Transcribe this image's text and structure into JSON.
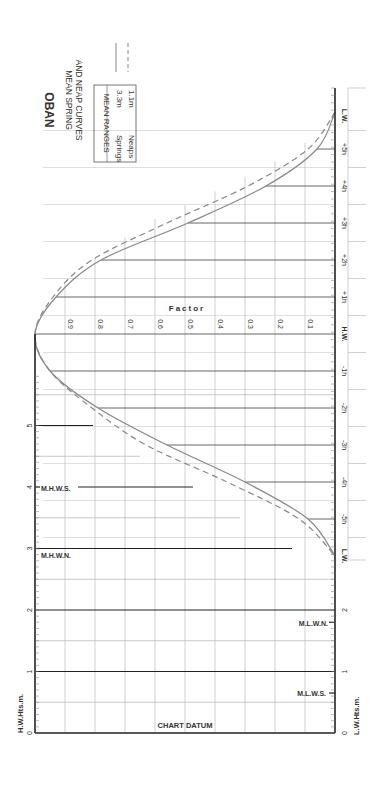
{
  "title": "OBAN",
  "subtitle_line1": "MEAN SPRING",
  "subtitle_line2": "AND NEAP CURVES",
  "legend": {
    "header": "MEAN RANGES",
    "rows": [
      {
        "label": "Springs",
        "value": "3.3m",
        "style": "solid"
      },
      {
        "label": "Neaps",
        "value": "1.1m",
        "style": "dashed"
      }
    ]
  },
  "axes": {
    "left_label": "H.W.Hts.m.",
    "right_label": "L.W.Hts.m.",
    "factor_label": "Factor",
    "datum_label": "CHART DATUM",
    "height_ticks": [
      "0",
      "1",
      "2",
      "3",
      "4",
      "5"
    ],
    "factor_ticks": [
      "0.9",
      "0.8",
      "0.7",
      "0.6",
      "0.5",
      "0.4",
      "0.3",
      "0.2",
      "0.1"
    ],
    "time_ticks_upper": [
      "L.W.",
      "+5h",
      "+4h",
      "+3h",
      "+2h",
      "+1h",
      "H.W."
    ],
    "time_ticks_lower": [
      "-1h",
      "-2h",
      "-3h",
      "-4h",
      "-5h",
      "L.W."
    ]
  },
  "levels": {
    "mhws": {
      "label": "M.H.W.S.",
      "value": 4.0
    },
    "mhwn": {
      "label": "M.H.W.N.",
      "value": 3.0
    },
    "mlwn": {
      "label": "M.L.W.N.",
      "value": 1.8
    },
    "mlws": {
      "label": "M.L.W.S.",
      "value": 0.65
    }
  },
  "colors": {
    "axis": "#222222",
    "grid": "#bbbbbb",
    "curve": "#888888",
    "hour_line": "#555555"
  },
  "chart_data": {
    "type": "line",
    "xlabel": "Time relative to High Water (hours)",
    "ylabel": "Factor",
    "x": [
      -6,
      -5,
      -4,
      -3,
      -2,
      -1,
      0,
      1,
      2,
      3,
      4,
      5,
      6
    ],
    "x_labels": [
      "L.W.",
      "-5h",
      "-4h",
      "-3h",
      "-2h",
      "-1h",
      "H.W.",
      "+1h",
      "+2h",
      "+3h",
      "+4h",
      "+5h",
      "L.W."
    ],
    "series": [
      {
        "name": "Springs (3.3m)",
        "style": "solid",
        "values": [
          0.0,
          0.06,
          0.23,
          0.49,
          0.78,
          0.93,
          1.0,
          0.95,
          0.79,
          0.56,
          0.3,
          0.09,
          0.0
        ]
      },
      {
        "name": "Neaps (1.1m)",
        "style": "dashed",
        "values": [
          0.0,
          0.09,
          0.29,
          0.56,
          0.81,
          0.94,
          1.0,
          0.95,
          0.81,
          0.63,
          0.36,
          0.12,
          0.0
        ]
      }
    ],
    "ylim": [
      0,
      1
    ],
    "height_axis_m": {
      "min": 0,
      "max": 5,
      "ticks": [
        0,
        1,
        2,
        3,
        4,
        5
      ]
    },
    "grid": true
  }
}
